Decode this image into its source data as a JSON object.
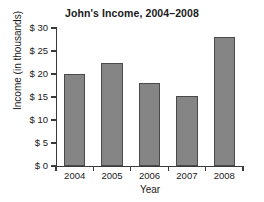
{
  "chart_data": {
    "type": "bar",
    "title": "John's Income, 2004–2008",
    "xlabel": "Year",
    "ylabel": "Income (in thousands)",
    "categories": [
      "2004",
      "2005",
      "2006",
      "2007",
      "2008"
    ],
    "values": [
      20.1,
      22.5,
      18.1,
      15.2,
      28.0
    ],
    "ylim": [
      0,
      30
    ],
    "ytick_values": [
      0,
      5,
      10,
      15,
      20,
      25,
      30
    ],
    "ytick_labels": [
      "$ 0",
      "$ 5",
      "$ 10",
      "$ 15",
      "$ 20",
      "$ 25",
      "$ 30"
    ],
    "grid": false,
    "legend": null,
    "bar_color": "#858585",
    "bar_edge_color": "#4a4a4a",
    "background_color": "#ffffff",
    "text_color": "#1a1a1a"
  }
}
